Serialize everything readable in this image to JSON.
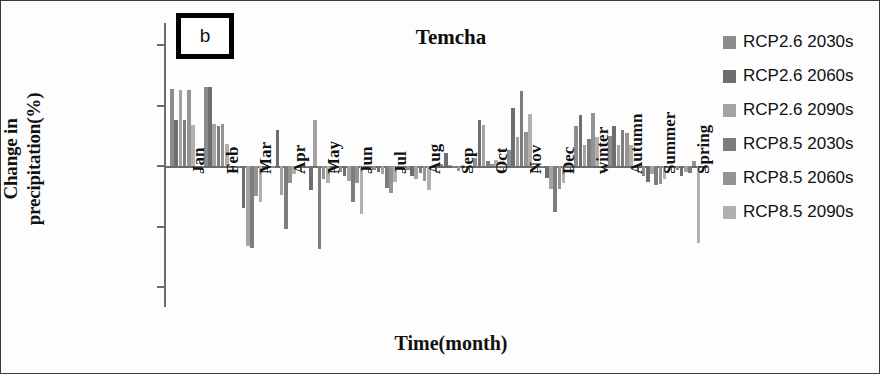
{
  "figure": {
    "panel_tag": "b",
    "title": "Temcha",
    "border_color": "#3a3a3a"
  },
  "axes": {
    "ylabel": "Change in\nprecipitation(%)",
    "xlabel": "Time(month)",
    "ytick_labels": [
      "100.00",
      "50.00",
      "0.00",
      "-50.00",
      "-100.00"
    ]
  },
  "legend": {
    "position": "right",
    "items": [
      {
        "label": "RCP2.6 2030s",
        "color": "#8c8c8c"
      },
      {
        "label": "RCP2.6 2060s",
        "color": "#6e6e6e"
      },
      {
        "label": "RCP2.6 2090s",
        "color": "#a3a3a3"
      },
      {
        "label": "RCP8.5 2030s",
        "color": "#7d7d7d"
      },
      {
        "label": "RCP8.5 2060s",
        "color": "#949494"
      },
      {
        "label": "RCP8.5 2090s",
        "color": "#b0b0b0"
      }
    ]
  },
  "chart_data": {
    "type": "bar",
    "title": "Temcha",
    "xlabel": "Time(month)",
    "ylabel": "Change in precipitation(%)",
    "ylim": [
      -100,
      100
    ],
    "ytick_values": [
      100,
      50,
      0,
      -50,
      -100
    ],
    "grid": false,
    "legend_position": "right",
    "categories": [
      "Jan",
      "Feb",
      "Mar",
      "Apr",
      "May",
      "Jun",
      "Jul",
      "Aug",
      "Sep",
      "Oct",
      "Nov",
      "Dec",
      "winter",
      "Autumn",
      "Summer",
      "Spring"
    ],
    "series": [
      {
        "name": "RCP2.6 2030s",
        "color": "#8c8c8c",
        "values": [
          64,
          65,
          -1,
          -2,
          -1,
          -5,
          -3,
          -3,
          2,
          7,
          13,
          -1,
          33,
          25,
          -8,
          -3
        ]
      },
      {
        "name": "RCP2.6 2060s",
        "color": "#6e6e6e",
        "values": [
          38,
          65,
          -35,
          30,
          -20,
          -8,
          -5,
          -8,
          11,
          38,
          48,
          -10,
          42,
          33,
          -13,
          -8
        ]
      },
      {
        "name": "RCP2.6 2090s",
        "color": "#a3a3a3",
        "values": [
          63,
          35,
          -66,
          -24,
          38,
          -12,
          -7,
          -11,
          1,
          34,
          24,
          -19,
          17,
          17,
          -7,
          -5
        ]
      },
      {
        "name": "RCP8.5 2030s",
        "color": "#7d7d7d",
        "values": [
          38,
          33,
          -68,
          -52,
          -69,
          -30,
          -18,
          -6,
          -2,
          4,
          62,
          -38,
          22,
          30,
          -16,
          -6
        ]
      },
      {
        "name": "RCP8.5 2060s",
        "color": "#949494",
        "values": [
          63,
          35,
          -25,
          -14,
          -11,
          -14,
          -22,
          -12,
          -4,
          2,
          28,
          -19,
          44,
          27,
          -15,
          4
        ]
      },
      {
        "name": "RCP8.5 2090s",
        "color": "#b0b0b0",
        "values": [
          34,
          18,
          -30,
          -7,
          -14,
          -40,
          -13,
          -20,
          0,
          5,
          43,
          -14,
          24,
          17,
          -11,
          -64
        ]
      }
    ]
  }
}
